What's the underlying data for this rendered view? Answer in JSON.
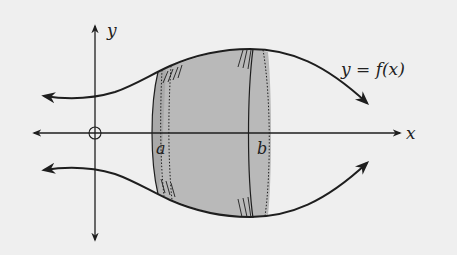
{
  "diagram": {
    "labels": {
      "x_axis": "x",
      "y_axis": "y",
      "function": "y = f(x)",
      "lower_bound": "a",
      "upper_bound": "b"
    },
    "colors": {
      "background": "#efefef",
      "stroke": "#1e1e1e",
      "solid_fill": "#b9b9b9",
      "solid_fill_dark": "#a9a9a9"
    }
  }
}
